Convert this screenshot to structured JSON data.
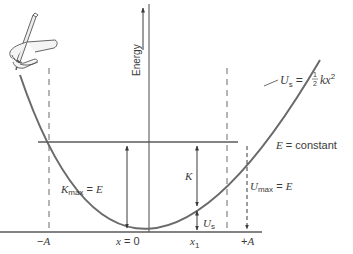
{
  "diagram": {
    "y_axis_label": "Energy",
    "curve_label": {
      "symbol": "U",
      "subscript": "s",
      "equals": "=",
      "fraction_num": "1",
      "fraction_den": "2",
      "expr": "kx",
      "exponent": "2"
    },
    "energy_line_label": {
      "symbol": "E",
      "rest": " = constant"
    },
    "kmax_label": {
      "symbol": "K",
      "subscript": "max",
      "rest": " = ",
      "rhs": "E"
    },
    "umax_label": {
      "symbol": "U",
      "subscript": "max",
      "rest": " = ",
      "rhs": "E"
    },
    "k_label": "K",
    "us_label": {
      "symbol": "U",
      "subscript": "s"
    },
    "x_ticks": [
      {
        "id": "neg-a",
        "label_sign": "−",
        "label_var": "A"
      },
      {
        "id": "zero",
        "label_var": "x",
        "label_rest": " = 0"
      },
      {
        "id": "x1",
        "label_var": "x",
        "label_sub": "1"
      },
      {
        "id": "pos-a",
        "label_sign": "+",
        "label_var": "A"
      }
    ],
    "colors": {
      "curve": "#6a6a6a",
      "lines": "#5a5a5a",
      "text": "#3a3a3a",
      "background": "#ffffff"
    },
    "decoration": "hand-with-pencil-icon"
  }
}
